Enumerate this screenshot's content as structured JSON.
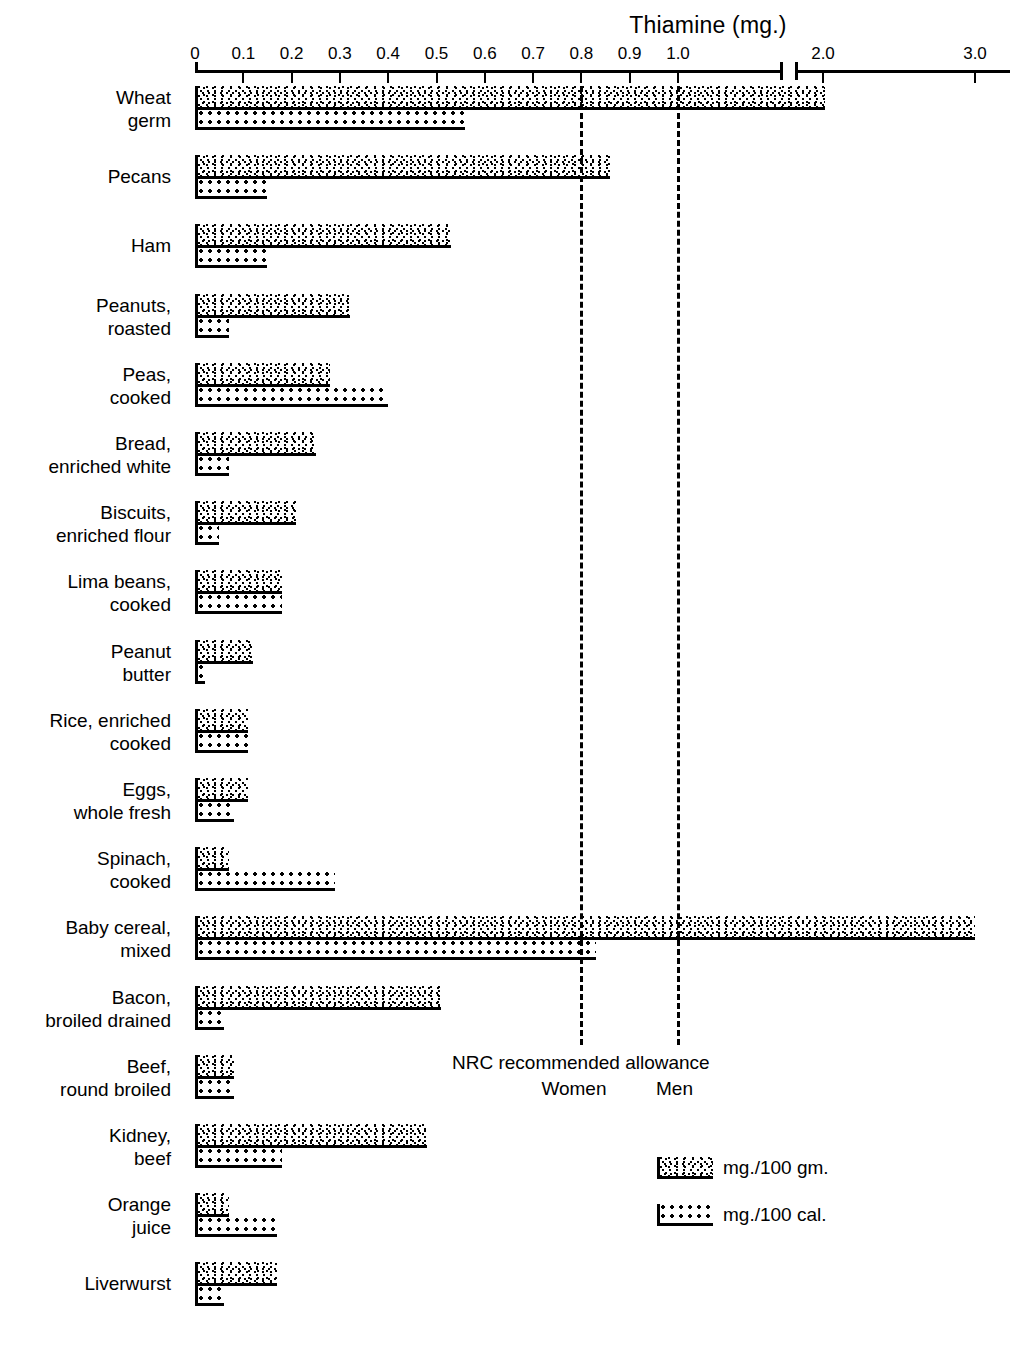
{
  "chart_data": {
    "type": "bar",
    "orientation": "horizontal",
    "title": "Thiamine (mg.)",
    "xlabel": "",
    "ylabel": "",
    "grid": false,
    "legend_position": "bottom-right",
    "axis": {
      "tick_labels": [
        "0",
        "0.1",
        "0.2",
        "0.3",
        "0.4",
        "0.5",
        "0.6",
        "0.7",
        "0.8",
        "0.9",
        "1.0",
        "2.0",
        "3.0"
      ],
      "tick_values": [
        0,
        0.1,
        0.2,
        0.3,
        0.4,
        0.5,
        0.6,
        0.7,
        0.8,
        0.9,
        1.0,
        2.0,
        3.0
      ],
      "axis_break_after": 1.1,
      "xlim": [
        0,
        3.05
      ]
    },
    "series": [
      {
        "name": "mg./100 gm.",
        "key": "gm"
      },
      {
        "name": "mg./100 cal.",
        "key": "cal"
      }
    ],
    "categories": [
      "Wheat\ngerm",
      "Pecans",
      "Ham",
      "Peanuts,\nroasted",
      "Peas,\ncooked",
      "Bread,\nenriched white",
      "Biscuits,\nenriched flour",
      "Lima beans,\ncooked",
      "Peanut\nbutter",
      "Rice, enriched\ncooked",
      "Eggs,\nwhole fresh",
      "Spinach,\ncooked",
      "Baby cereal,\nmixed",
      "Bacon,\nbroiled drained",
      "Beef,\nround broiled",
      "Kidney,\nbeef",
      "Orange\njuice",
      "Liverwurst"
    ],
    "rows": [
      {
        "label": "Wheat\ngerm",
        "gm": 2.01,
        "cal": 0.56
      },
      {
        "label": "Pecans",
        "gm": 0.86,
        "cal": 0.15
      },
      {
        "label": "Ham",
        "gm": 0.53,
        "cal": 0.15
      },
      {
        "label": "Peanuts,\nroasted",
        "gm": 0.32,
        "cal": 0.07
      },
      {
        "label": "Peas,\ncooked",
        "gm": 0.28,
        "cal": 0.4
      },
      {
        "label": "Bread,\nenriched white",
        "gm": 0.25,
        "cal": 0.07
      },
      {
        "label": "Biscuits,\nenriched flour",
        "gm": 0.21,
        "cal": 0.05
      },
      {
        "label": "Lima beans,\ncooked",
        "gm": 0.18,
        "cal": 0.18
      },
      {
        "label": "Peanut\nbutter",
        "gm": 0.12,
        "cal": 0.02
      },
      {
        "label": "Rice, enriched\ncooked",
        "gm": 0.11,
        "cal": 0.11
      },
      {
        "label": "Eggs,\nwhole fresh",
        "gm": 0.11,
        "cal": 0.08
      },
      {
        "label": "Spinach,\ncooked",
        "gm": 0.07,
        "cal": 0.29
      },
      {
        "label": "Baby cereal,\nmixed",
        "gm": 3.0,
        "cal": 0.83
      },
      {
        "label": "Bacon,\nbroiled drained",
        "gm": 0.51,
        "cal": 0.06
      },
      {
        "label": "Beef,\nround broiled",
        "gm": 0.08,
        "cal": 0.08
      },
      {
        "label": "Kidney,\nbeef",
        "gm": 0.48,
        "cal": 0.18
      },
      {
        "label": "Orange\njuice",
        "gm": 0.07,
        "cal": 0.17
      },
      {
        "label": "Liverwurst",
        "gm": 0.17,
        "cal": 0.06
      }
    ],
    "reference_lines": [
      {
        "label": "Women",
        "value": 0.8
      },
      {
        "label": "Men",
        "value": 1.0
      }
    ],
    "annotations": {
      "nrc_title": "NRC recommended allowance",
      "nrc_women": "Women",
      "nrc_men": "Men"
    }
  },
  "legend": {
    "items": [
      {
        "label": "mg./100 gm.",
        "pattern": "stipple"
      },
      {
        "label": "mg./100 cal.",
        "pattern": "dots"
      }
    ]
  },
  "colors": {
    "ink": "#000000",
    "paper": "#ffffff"
  }
}
